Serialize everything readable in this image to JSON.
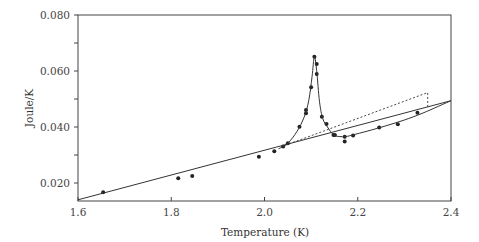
{
  "chart_data": {
    "type": "scatter",
    "title": "",
    "xlabel": "Temperature (K)",
    "ylabel": "Joule/K",
    "xlim": [
      1.6,
      2.4
    ],
    "ylim": [
      0.014,
      0.08
    ],
    "x_ticks": [
      1.6,
      1.8,
      2.0,
      2.2,
      2.4
    ],
    "x_tick_labels": [
      "1.6",
      "1.8",
      "2.0",
      "2.2",
      "2.4"
    ],
    "y_ticks": [
      0.02,
      0.03,
      0.04,
      0.05,
      0.06,
      0.07,
      0.08
    ],
    "y_tick_labels": [
      "0.020",
      "",
      "0.040",
      "",
      "0.060",
      "",
      "0.080"
    ],
    "grid": false,
    "legend": null,
    "series": [
      {
        "name": "measured data",
        "style": "points",
        "x": [
          1.654,
          1.815,
          1.845,
          1.988,
          2.021,
          2.04,
          2.05,
          2.075,
          2.089,
          2.089,
          2.1,
          2.107,
          2.112,
          2.112,
          2.123,
          2.133,
          2.148,
          2.151,
          2.172,
          2.172,
          2.19,
          2.246,
          2.286,
          2.328
        ],
        "y": [
          0.0167,
          0.0217,
          0.0225,
          0.0294,
          0.0313,
          0.033,
          0.0342,
          0.0401,
          0.0449,
          0.0461,
          0.0542,
          0.0651,
          0.0625,
          0.0589,
          0.0437,
          0.0411,
          0.0371,
          0.0371,
          0.0365,
          0.0348,
          0.037,
          0.0398,
          0.041,
          0.0451
        ]
      },
      {
        "name": "fitted curve through peak",
        "style": "solid-curve",
        "x": [
          2.03,
          2.05,
          2.07,
          2.085,
          2.095,
          2.102,
          2.107,
          2.112,
          2.118,
          2.125,
          2.135,
          2.148,
          2.16,
          2.175,
          2.19,
          2.22,
          2.26,
          2.3,
          2.34,
          2.4
        ],
        "y": [
          0.0322,
          0.0342,
          0.0385,
          0.0435,
          0.0495,
          0.058,
          0.0651,
          0.06,
          0.049,
          0.043,
          0.04,
          0.0372,
          0.0366,
          0.0366,
          0.0372,
          0.0385,
          0.0404,
          0.0425,
          0.045,
          0.0494
        ]
      },
      {
        "name": "background baseline",
        "style": "solid-line",
        "x": [
          1.6,
          2.4
        ],
        "y": [
          0.014,
          0.0494
        ]
      },
      {
        "name": "extrapolated baseline",
        "style": "dashed-line",
        "x": [
          2.045,
          2.35,
          2.35
        ],
        "y": [
          0.0335,
          0.0523,
          0.0466
        ]
      }
    ]
  }
}
